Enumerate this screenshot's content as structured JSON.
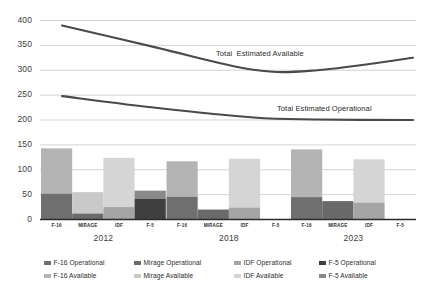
{
  "chart_data": {
    "type": "bar",
    "title": "",
    "xlabel": "",
    "ylabel": "",
    "ylim": [
      0,
      400
    ],
    "grid": true,
    "yticks": [
      "0",
      "50",
      "100",
      "150",
      "200",
      "250",
      "300",
      "350",
      "400"
    ],
    "ytick_values": [
      0,
      50,
      100,
      150,
      200,
      250,
      300,
      350,
      400
    ],
    "groups": [
      "2012",
      "2018",
      "2023"
    ],
    "categories": [
      "F-16",
      "MIRAGE",
      "IDF",
      "F-5"
    ],
    "stacked_bars": [
      {
        "group": "2012",
        "bars": [
          {
            "category": "F-16",
            "operational": 52,
            "available": 143
          },
          {
            "category": "MIRAGE",
            "operational": 12,
            "available": 55
          },
          {
            "category": "IDF",
            "operational": 25,
            "available": 124
          },
          {
            "category": "F-5",
            "operational": 42,
            "available": 58
          }
        ]
      },
      {
        "group": "2018",
        "bars": [
          {
            "category": "F-16",
            "operational": 46,
            "available": 117
          },
          {
            "category": "MIRAGE",
            "operational": 20,
            "available": 20
          },
          {
            "category": "IDF",
            "operational": 24,
            "available": 122
          },
          {
            "category": "F-5",
            "operational": 0,
            "available": 0
          }
        ]
      },
      {
        "group": "2023",
        "bars": [
          {
            "category": "F-16",
            "operational": 45,
            "available": 141
          },
          {
            "category": "MIRAGE",
            "operational": 37,
            "available": 37
          },
          {
            "category": "IDF",
            "operational": 34,
            "available": 121
          },
          {
            "category": "F-5",
            "operational": 0,
            "available": 0
          }
        ]
      }
    ],
    "lines": [
      {
        "name": "Total  Estimated Available",
        "label": "Total  Estimated Available",
        "label_x": 216,
        "label_y": 49,
        "points": [
          {
            "x": 2012,
            "y": 390
          },
          {
            "x": 2015,
            "y": 345
          },
          {
            "x": 2018,
            "y": 301
          },
          {
            "x": 2020,
            "y": 300
          },
          {
            "x": 2023,
            "y": 325
          }
        ]
      },
      {
        "name": "Total Estimated Operational",
        "label": "Total Estimated Operational",
        "label_x": 277,
        "label_y": 104,
        "points": [
          {
            "x": 2012,
            "y": 248
          },
          {
            "x": 2015,
            "y": 224
          },
          {
            "x": 2018,
            "y": 205
          },
          {
            "x": 2020,
            "y": 201
          },
          {
            "x": 2023,
            "y": 200
          }
        ]
      }
    ],
    "legend_position": "bottom",
    "legend": [
      {
        "label": "F-16 Operational",
        "color": "#6f6f6f"
      },
      {
        "label": "Mirage Operational",
        "color": "#6a6a6a"
      },
      {
        "label": "IDF Operational",
        "color": "#a5a5a5"
      },
      {
        "label": "F-5 Operational",
        "color": "#3f3f3f"
      },
      {
        "label": "F-16 Available",
        "color": "#b4b4b4"
      },
      {
        "label": "Mirage Available",
        "color": "#c9c9c9"
      },
      {
        "label": "IDF Available",
        "color": "#d5d5d5"
      },
      {
        "label": "F-5 Available",
        "color": "#8a8a8a"
      }
    ]
  },
  "axis": {
    "y_labels": [
      "400",
      "350",
      "300",
      "250",
      "200",
      "150",
      "100",
      "50",
      "0"
    ]
  },
  "groups_axis": [
    {
      "year": "2012",
      "categories": [
        "F-16",
        "MIRAGE",
        "IDF",
        "F-5"
      ]
    },
    {
      "year": "2018",
      "categories": [
        "F-16",
        "MIRAGE",
        "IDF",
        "F-5"
      ]
    },
    {
      "year": "2023",
      "categories": [
        "F-16",
        "MIRAGE",
        "IDF",
        "F-5"
      ]
    }
  ],
  "curve_labels": {
    "available": "Total  Estimated Available",
    "operational": "Total Estimated Operational"
  },
  "legend_rows": [
    [
      {
        "label": "F-16 Operational",
        "color": "#6f6f6f"
      },
      {
        "label": "Mirage Operational",
        "color": "#6a6a6a"
      },
      {
        "label": "IDF Operational",
        "color": "#a5a5a5"
      },
      {
        "label": "F-5 Operational",
        "color": "#3f3f3f"
      }
    ],
    [
      {
        "label": "F-16 Available",
        "color": "#b4b4b4"
      },
      {
        "label": "Mirage Available",
        "color": "#c9c9c9"
      },
      {
        "label": "IDF Available",
        "color": "#d5d5d5"
      },
      {
        "label": "F-5 Available",
        "color": "#8a8a8a"
      }
    ]
  ],
  "colors": {
    "grid": "#c8c8c8",
    "axis": "#2b2b2b",
    "curve": "#4a4a4a",
    "text": "#2b2b2b",
    "background": "#ffffff"
  }
}
